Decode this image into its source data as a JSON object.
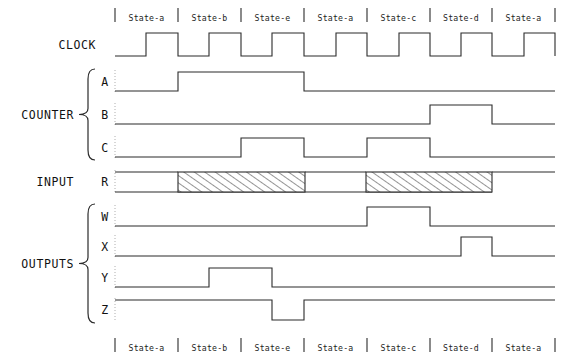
{
  "diagram": {
    "type": "timing-diagram"
  },
  "states": {
    "top_labels": [
      "State-a",
      "State-b",
      "State-e",
      "State-a",
      "State-c",
      "State-d",
      "State-a"
    ],
    "bottom_labels": [
      "State-a",
      "State-b",
      "State-e",
      "State-a",
      "State-c",
      "State-d",
      "State-a"
    ],
    "boundaries_x": [
      115,
      178,
      241,
      304,
      367,
      430,
      492,
      555
    ]
  },
  "groups": [
    {
      "name": "clock-group",
      "label": "CLOCK",
      "has_brace": false,
      "signals": [
        "CLOCK"
      ]
    },
    {
      "name": "counter-group",
      "label": "COUNTER",
      "has_brace": true,
      "signals": [
        "A",
        "B",
        "C"
      ]
    },
    {
      "name": "input-group",
      "label": "INPUT",
      "has_brace": false,
      "signals": [
        "R"
      ]
    },
    {
      "name": "outputs-group",
      "label": "OUTPUTS",
      "has_brace": true,
      "signals": [
        "W",
        "X",
        "Y",
        "Z"
      ]
    }
  ],
  "signal_rows": [
    {
      "name": "CLOCK",
      "label": "CLOCK",
      "group": "CLOCK",
      "baseline_y": 56,
      "top_y": 33,
      "kind": "clock"
    },
    {
      "name": "A",
      "label": "A",
      "group": "COUNTER",
      "baseline_y": 91,
      "top_y": 72,
      "kind": "level"
    },
    {
      "name": "B",
      "label": "B",
      "group": "COUNTER",
      "baseline_y": 124,
      "top_y": 105,
      "kind": "level"
    },
    {
      "name": "C",
      "label": "C",
      "group": "COUNTER",
      "baseline_y": 157,
      "top_y": 138,
      "kind": "level"
    },
    {
      "name": "R",
      "label": "R",
      "group": "INPUT",
      "baseline_y": 192,
      "top_y": 172,
      "kind": "hatched"
    },
    {
      "name": "W",
      "label": "W",
      "group": "OUTPUTS",
      "baseline_y": 226,
      "top_y": 207,
      "kind": "level"
    },
    {
      "name": "X",
      "label": "X",
      "group": "OUTPUTS",
      "baseline_y": 256,
      "top_y": 237,
      "kind": "level"
    },
    {
      "name": "Y",
      "label": "Y",
      "group": "OUTPUTS",
      "baseline_y": 287,
      "top_y": 268,
      "kind": "level"
    },
    {
      "name": "Z",
      "label": "Z",
      "group": "OUTPUTS",
      "baseline_y": 320,
      "top_y": 300,
      "kind": "level"
    }
  ],
  "waveforms": {
    "CLOCK": {
      "description": "Square clock, 7 full cycles, low for first half of each state",
      "start_level": 0,
      "transitions_x": [
        146,
        178,
        209,
        241,
        272,
        304,
        336,
        367,
        399,
        430,
        461,
        492,
        524,
        555
      ]
    },
    "A": {
      "description": "Counter bit A: high from state-b start through state-e end",
      "start_level": 0,
      "transitions_x": [
        178,
        304
      ]
    },
    "B": {
      "description": "Counter bit B: high during state-d",
      "start_level": 0,
      "transitions_x": [
        430,
        492
      ]
    },
    "C": {
      "description": "Counter bit C: high during state-e and during state-c",
      "start_level": 0,
      "transitions_x": [
        241,
        304,
        367,
        430
      ]
    },
    "R": {
      "description": "Input R: high, with two don't-care hatched windows",
      "start_level": 1,
      "hatched_regions": [
        {
          "x_start": 178,
          "x_end": 305
        },
        {
          "x_start": 366,
          "x_end": 492
        }
      ]
    },
    "W": {
      "description": "Output W: pulse high during state-c",
      "start_level": 0,
      "transitions_x": [
        367,
        430
      ]
    },
    "X": {
      "description": "Output X: narrow pulse high late in state-d",
      "start_level": 0,
      "transitions_x": [
        461,
        492
      ]
    },
    "Y": {
      "description": "Output Y: pulse high mid state-b into state-e",
      "start_level": 0,
      "transitions_x": [
        209,
        272
      ]
    },
    "Z": {
      "description": "Output Z: high, dips low between state-e and state-a",
      "start_level": 1,
      "transitions_x": [
        272,
        304
      ]
    }
  },
  "colors": {
    "wave_stroke": "#2b2b2b",
    "text": "#111111",
    "guide": "#9a9a9a",
    "background": "#ffffff"
  },
  "geometry": {
    "wave_x_start": 115,
    "wave_x_end": 555,
    "top_label_y": 18,
    "bottom_label_y": 348
  }
}
